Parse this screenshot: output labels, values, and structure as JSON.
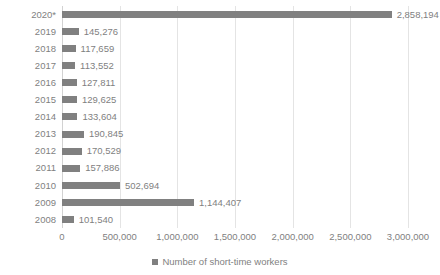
{
  "chart_data": {
    "type": "bar",
    "orientation": "horizontal",
    "title": "",
    "xlabel": "",
    "ylabel": "",
    "categories": [
      "2020*",
      "2019",
      "2018",
      "2017",
      "2016",
      "2015",
      "2014",
      "2013",
      "2012",
      "2011",
      "2010",
      "2009",
      "2008"
    ],
    "values": [
      2858194,
      145276,
      117659,
      113552,
      127811,
      129625,
      133604,
      190845,
      170529,
      157886,
      502694,
      1144407,
      101540
    ],
    "value_labels": [
      "2,858,194",
      "145,276",
      "117,659",
      "113,552",
      "127,811",
      "129,625",
      "133,604",
      "190,845",
      "170,529",
      "157,886",
      "502,694",
      "1,144,407",
      "101,540"
    ],
    "series": [
      {
        "name": "Number of short-time workers",
        "color": "#808080",
        "values": [
          2858194,
          145276,
          117659,
          113552,
          127811,
          129625,
          133604,
          190845,
          170529,
          157886,
          502694,
          1144407,
          101540
        ]
      }
    ],
    "xlim": [
      0,
      3000000
    ],
    "xticks": [
      0,
      500000,
      1000000,
      1500000,
      2000000,
      2500000,
      3000000
    ],
    "xtick_labels": [
      "0",
      "500,000",
      "1,000,000",
      "1,500,000",
      "2,000,000",
      "2,500,000",
      "3,000,000"
    ],
    "grid": "vertical",
    "data_labels": true,
    "legend": {
      "position": "bottom",
      "entries": [
        {
          "label": "Number of short-time workers",
          "color": "#808080",
          "marker": "square-marker"
        }
      ]
    }
  },
  "colors": {
    "bar": "#808080",
    "text": "#7f7f7f",
    "gridline": "#e4e4e4",
    "axis": "#d2d2d2",
    "background": "#ffffff"
  }
}
